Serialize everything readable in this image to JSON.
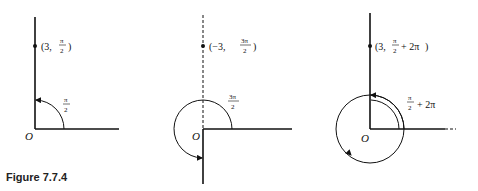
{
  "figure": {
    "caption": "Figure 7.7.4",
    "panels": [
      {
        "origin_label": "O",
        "point": {
          "r": "3",
          "theta_num": "π",
          "theta_den": "2",
          "theta_extra": ""
        },
        "point_prefix": "(3,",
        "angle_label": {
          "num": "π",
          "den": "2",
          "extra": ""
        }
      },
      {
        "origin_label": "O",
        "point": {
          "r": "−3",
          "theta_num": "3π",
          "theta_den": "2",
          "theta_extra": ""
        },
        "point_prefix": "(−3,",
        "angle_label": {
          "num": "3π",
          "den": "2",
          "extra": ""
        }
      },
      {
        "origin_label": "O",
        "point": {
          "r": "3",
          "theta_num": "π",
          "theta_den": "2",
          "theta_extra": "+ 2π"
        },
        "point_prefix": "(3,",
        "angle_label": {
          "num": "π",
          "den": "2",
          "extra": "+ 2π"
        }
      }
    ],
    "close_paren": ")"
  }
}
